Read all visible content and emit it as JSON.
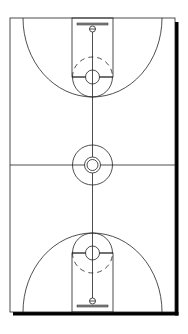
{
  "diagram": {
    "type": "full-court-top-view",
    "colors": {
      "background": "#ffffff",
      "lines": "#222222",
      "shadow": "#000000",
      "backboard": "#888888"
    },
    "court": {
      "x": 10,
      "y": 18,
      "width": 165,
      "height": 294
    },
    "shadow_offset": 3,
    "midcourt": {
      "y": 165
    },
    "center_circle": {
      "cx": 92.5,
      "cy": 165,
      "outer_r": 20,
      "middle_r": 8,
      "inner_r": 5.5
    },
    "halves": [
      {
        "name": "top",
        "lane": {
          "x": 72,
          "y": 18,
          "width": 41,
          "height": 59
        },
        "free_throw_line_y": 77,
        "free_throw_circle_r": 20,
        "three_point_arc": {
          "left_x": 23,
          "right_x": 162,
          "apex_y": 97
        },
        "backboard": {
          "x1": 77,
          "x2": 108,
          "y": 24
        },
        "rim": {
          "cx": 92.5,
          "cy": 29,
          "r": 3
        }
      },
      {
        "name": "bottom",
        "lane": {
          "x": 72,
          "y": 253,
          "width": 41,
          "height": 59
        },
        "free_throw_line_y": 253,
        "free_throw_circle_r": 20,
        "three_point_arc": {
          "left_x": 23,
          "right_x": 162,
          "apex_y": 233
        },
        "backboard": {
          "x1": 77,
          "x2": 108,
          "y": 306
        },
        "rim": {
          "cx": 92.5,
          "cy": 301,
          "r": 3
        }
      }
    ]
  }
}
